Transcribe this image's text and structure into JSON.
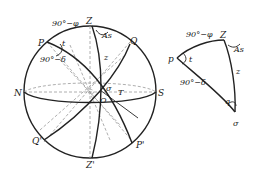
{
  "figure": {
    "sphere": {
      "labels": {
        "zenith": "Z",
        "nadir": "Z'",
        "pole": "P",
        "pole_south": "P'",
        "equator_point": "Q",
        "equator_point_opposite": "Q'",
        "north": "N",
        "south": "S",
        "center": "O",
        "star": "σ",
        "point_T": "T",
        "colatitude": "90°−φ",
        "codeclination": "90°−δ",
        "hour_angle": "t",
        "azimuth": "As",
        "zenith_distance": "z"
      }
    },
    "triangle": {
      "labels": {
        "pole": "p",
        "zenith": "Z",
        "star": "σ",
        "colatitude": "90°−φ",
        "codeclination": "90°−δ",
        "hour_angle": "t",
        "azimuth": "As",
        "zenith_distance": "z",
        "parallactic_angle": "q"
      }
    }
  }
}
